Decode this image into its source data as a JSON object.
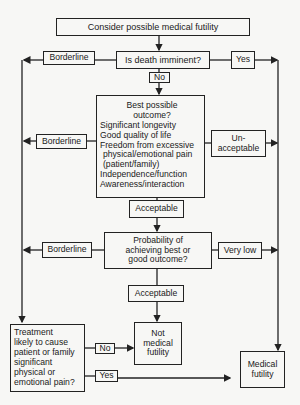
{
  "diagram": {
    "start": "Consider possible medical futility",
    "q1": {
      "text": "Is death imminent?",
      "left": "Borderline",
      "right": "Yes",
      "down": "No"
    },
    "q2": {
      "lines": [
        "Best possible",
        "outcome?",
        "Significant longevity",
        "Good quality of life",
        "Freedom from excessive",
        "physical/emotional pain",
        "(patient/family)",
        "Independence/function",
        "Awareness/interaction"
      ],
      "left": "Borderline",
      "right_lines": [
        "Un-",
        "acceptable"
      ],
      "down": "Acceptable"
    },
    "q3": {
      "lines": [
        "Probability of",
        "achieving best or",
        "good outcome?"
      ],
      "left": "Borderline",
      "right": "Very low",
      "down": "Acceptable"
    },
    "q4": {
      "lines": [
        "Treatment",
        "likely to cause",
        "patient or family",
        "significant",
        "physical or",
        "emotional pain?"
      ],
      "no": "No",
      "yes": "Yes"
    },
    "outcome_not": [
      "Not",
      "medical",
      "futility"
    ],
    "outcome_futile": [
      "Medical",
      "futility"
    ]
  }
}
